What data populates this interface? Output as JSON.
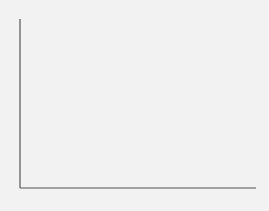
{
  "chart_data": {
    "type": "line",
    "title": "",
    "xlabel": "N",
    "ylabel": "A",
    "grid": false,
    "y_ticks": 8,
    "series": [
      {
        "name": "J1",
        "color": "#5a5a5a",
        "label_pos": "right",
        "points": [
          [
            31,
            20
          ],
          [
            36,
            55
          ],
          [
            48,
            90
          ],
          [
            70,
            120
          ],
          [
            110,
            142
          ],
          [
            160,
            156
          ],
          [
            210,
            163
          ],
          [
            255,
            166
          ]
        ]
      },
      {
        "name": "J2",
        "color": "#8a8a8a",
        "label_pos": "right",
        "points": [
          [
            39,
            20
          ],
          [
            45,
            55
          ],
          [
            62,
            88
          ],
          [
            95,
            115
          ],
          [
            140,
            133
          ],
          [
            190,
            145
          ],
          [
            230,
            151
          ],
          [
            255,
            154
          ]
        ]
      },
      {
        "name": "S1",
        "color": "#2e2e2e",
        "label_pos": "top",
        "points": [
          [
            70,
            20
          ],
          [
            78,
            60
          ],
          [
            92,
            100
          ],
          [
            112,
            130
          ],
          [
            140,
            152
          ],
          [
            180,
            166
          ],
          [
            220,
            172
          ],
          [
            255,
            174
          ]
        ]
      },
      {
        "name": "S2",
        "color": "#7a7a7a",
        "label_pos": "top",
        "points": [
          [
            87,
            20
          ],
          [
            96,
            60
          ],
          [
            112,
            98
          ],
          [
            135,
            125
          ],
          [
            165,
            145
          ],
          [
            205,
            158
          ],
          [
            235,
            163
          ],
          [
            255,
            165
          ]
        ]
      }
    ],
    "annotations": [
      "A",
      "N",
      "S1",
      "S2",
      "J1",
      "J2"
    ]
  },
  "labels": {
    "y_axis": "A",
    "x_axis": "N",
    "s1_main": "S",
    "s1_sub": "1",
    "s2_main": "S",
    "s2_sub": "2",
    "j1_main": "J",
    "j1_sub": "1",
    "j2_main": "J",
    "j2_sub": "2"
  }
}
